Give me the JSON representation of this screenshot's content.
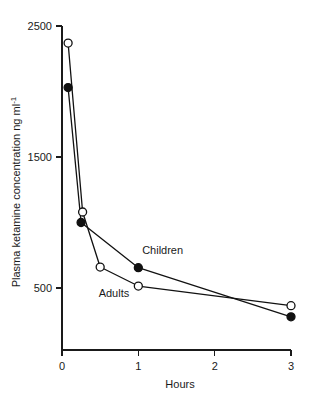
{
  "chart_data": {
    "type": "line",
    "title": "",
    "xlabel": "Hours",
    "ylabel": "Plasma ketamine concentration ng ml",
    "ylabel_exponent": "-1",
    "xlim": [
      0,
      3
    ],
    "ylim": [
      0,
      2500
    ],
    "grid": false,
    "legend": "inline-annotations",
    "x_ticks": [
      0,
      1,
      2,
      3
    ],
    "x_tick_labels": [
      "0",
      "1",
      "2",
      "3"
    ],
    "y_ticks": [
      500,
      1500,
      2500
    ],
    "y_tick_labels": [
      "500",
      "1500",
      "2500"
    ],
    "series": [
      {
        "name": "Children",
        "marker": "filled-circle",
        "label": "Children",
        "x": [
          0.08,
          0.25,
          1.0,
          3.0
        ],
        "values": [
          2030,
          1000,
          655,
          280
        ]
      },
      {
        "name": "Adults",
        "marker": "open-circle",
        "label": "Adults",
        "x": [
          0.08,
          0.27,
          0.5,
          1.0,
          3.0
        ],
        "values": [
          2370,
          1080,
          660,
          515,
          365
        ]
      }
    ],
    "annotations": [
      {
        "text": "Children",
        "x": 1.05,
        "y": 760
      },
      {
        "text": "Adults",
        "x": 0.48,
        "y": 430
      }
    ],
    "colors": {
      "axis": "#1a1a1a",
      "line": "#111111",
      "marker_fill_open": "#ffffff",
      "marker_fill_closed": "#111111",
      "background": "#ffffff"
    }
  }
}
